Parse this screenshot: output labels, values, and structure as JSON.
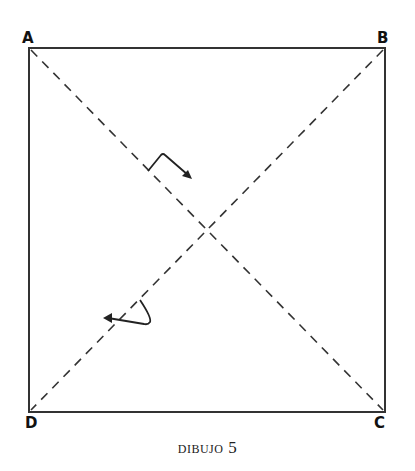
{
  "diagram": {
    "type": "square-with-diagonals",
    "vertices": [
      {
        "label": "A",
        "x": 29,
        "y": 48
      },
      {
        "label": "B",
        "x": 385,
        "y": 48
      },
      {
        "label": "C",
        "x": 385,
        "y": 412
      },
      {
        "label": "D",
        "x": 29,
        "y": 412
      }
    ],
    "diagonals": [
      {
        "from": "A",
        "to": "C",
        "style": "dashed"
      },
      {
        "from": "B",
        "to": "D",
        "style": "dashed"
      }
    ],
    "fold_arrows": [
      {
        "position": "upper",
        "direction": "down-right"
      },
      {
        "position": "lower",
        "direction": "left"
      }
    ],
    "colors": {
      "line": "#333333",
      "label": "#111111",
      "background": "#ffffff"
    }
  },
  "labels": {
    "a": "A",
    "b": "B",
    "c": "C",
    "d": "D"
  },
  "caption": {
    "word": "DIBUJO",
    "number": "5"
  }
}
